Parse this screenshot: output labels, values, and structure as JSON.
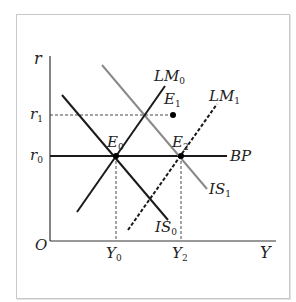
{
  "diagram": {
    "type": "IS-LM-BP model",
    "axes": {
      "y_label": "r",
      "x_label": "Y",
      "origin_label": "O"
    },
    "y_ticks": [
      {
        "base": "r",
        "sub": "1",
        "name": "r1"
      },
      {
        "base": "r",
        "sub": "0",
        "name": "r0"
      }
    ],
    "x_ticks": [
      {
        "base": "Y",
        "sub": "0",
        "name": "Y0"
      },
      {
        "base": "Y",
        "sub": "2",
        "name": "Y2"
      }
    ],
    "curves": {
      "LM0": {
        "base": "LM",
        "sub": "0",
        "color": "#1a1a1a",
        "style": "solid"
      },
      "LM1": {
        "base": "LM",
        "sub": "1",
        "color": "#1a1a1a",
        "style": "dashed"
      },
      "IS0": {
        "base": "IS",
        "sub": "0",
        "color": "#1a1a1a",
        "style": "solid"
      },
      "IS1": {
        "base": "IS",
        "sub": "1",
        "color": "#8a8a8a",
        "style": "solid"
      },
      "BP": {
        "label": "BP",
        "color": "#1a1a1a",
        "style": "solid"
      }
    },
    "points": {
      "E0": {
        "base": "E",
        "sub": "0"
      },
      "E1": {
        "base": "E",
        "sub": "1"
      },
      "E2": {
        "base": "E",
        "sub": "2"
      }
    }
  }
}
